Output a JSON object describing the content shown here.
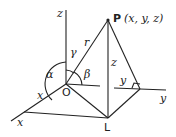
{
  "diagram": {
    "point_label": "P",
    "point_coords": "(x, y, z)",
    "origin_label": "O",
    "foot_label": "L",
    "axis_z": "z",
    "axis_y": "y",
    "axis_x": "x",
    "segment_r": "r",
    "segment_z": "z",
    "segment_y": "y",
    "segment_x": "x",
    "angle_alpha": "α",
    "angle_beta": "β",
    "angle_gamma": "γ"
  }
}
